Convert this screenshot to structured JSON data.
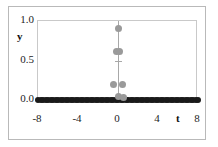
{
  "chart_data": {
    "type": "scatter",
    "title": "",
    "xlabel": "t",
    "ylabel": "y",
    "xlim": [
      -8,
      8
    ],
    "ylim": [
      0.0,
      1.0
    ],
    "xticks": [
      -8,
      -4,
      0,
      4,
      8
    ],
    "xticklabels": [
      "-8",
      "-4",
      "0",
      "4",
      "8"
    ],
    "yticks": [
      0.0,
      0.5,
      1.0
    ],
    "yticklabels": [
      "0.0",
      "0.5",
      "1.0"
    ],
    "grid": false,
    "legend": null,
    "marker_colors": {
      "baseline": "#1a1a1a",
      "impulse": "#9a9a9a",
      "impulse_line": "#a8a8a8"
    },
    "series": [
      {
        "name": "baseline",
        "marker": "filled-circle-black",
        "points": [
          {
            "t": -8.0,
            "y": 0.0
          },
          {
            "t": -7.75,
            "y": 0.0
          },
          {
            "t": -7.5,
            "y": 0.0
          },
          {
            "t": -7.25,
            "y": 0.0
          },
          {
            "t": -7.0,
            "y": 0.0
          },
          {
            "t": -6.75,
            "y": 0.0
          },
          {
            "t": -6.5,
            "y": 0.0
          },
          {
            "t": -6.25,
            "y": 0.0
          },
          {
            "t": -6.0,
            "y": 0.0
          },
          {
            "t": -5.75,
            "y": 0.0
          },
          {
            "t": -5.5,
            "y": 0.0
          },
          {
            "t": -5.25,
            "y": 0.0
          },
          {
            "t": -5.0,
            "y": 0.0
          },
          {
            "t": -4.75,
            "y": 0.0
          },
          {
            "t": -4.5,
            "y": 0.0
          },
          {
            "t": -4.25,
            "y": 0.0
          },
          {
            "t": -4.0,
            "y": 0.0
          },
          {
            "t": -3.75,
            "y": 0.0
          },
          {
            "t": -3.5,
            "y": 0.0
          },
          {
            "t": -3.25,
            "y": 0.0
          },
          {
            "t": -3.0,
            "y": 0.0
          },
          {
            "t": -2.75,
            "y": 0.0
          },
          {
            "t": -2.5,
            "y": 0.0
          },
          {
            "t": -2.25,
            "y": 0.0
          },
          {
            "t": -2.0,
            "y": 0.0
          },
          {
            "t": -1.75,
            "y": 0.0
          },
          {
            "t": -1.5,
            "y": 0.0
          },
          {
            "t": -1.25,
            "y": 0.0
          },
          {
            "t": -1.0,
            "y": 0.0
          },
          {
            "t": -0.75,
            "y": 0.0
          },
          {
            "t": -0.5,
            "y": 0.0
          },
          {
            "t": -0.25,
            "y": 0.0
          },
          {
            "t": 0.0,
            "y": 0.0
          },
          {
            "t": 0.25,
            "y": 0.0
          },
          {
            "t": 0.5,
            "y": 0.0
          },
          {
            "t": 0.75,
            "y": 0.0
          },
          {
            "t": 1.0,
            "y": 0.0
          },
          {
            "t": 1.25,
            "y": 0.0
          },
          {
            "t": 1.5,
            "y": 0.0
          },
          {
            "t": 1.75,
            "y": 0.0
          },
          {
            "t": 2.0,
            "y": 0.0
          },
          {
            "t": 2.25,
            "y": 0.0
          },
          {
            "t": 2.5,
            "y": 0.0
          },
          {
            "t": 2.75,
            "y": 0.0
          },
          {
            "t": 3.0,
            "y": 0.0
          },
          {
            "t": 3.25,
            "y": 0.0
          },
          {
            "t": 3.5,
            "y": 0.0
          },
          {
            "t": 3.75,
            "y": 0.0
          },
          {
            "t": 4.0,
            "y": 0.0
          },
          {
            "t": 4.25,
            "y": 0.0
          },
          {
            "t": 4.5,
            "y": 0.0
          },
          {
            "t": 4.75,
            "y": 0.0
          },
          {
            "t": 5.0,
            "y": 0.0
          },
          {
            "t": 5.25,
            "y": 0.0
          },
          {
            "t": 5.5,
            "y": 0.0
          },
          {
            "t": 5.75,
            "y": 0.0
          },
          {
            "t": 6.0,
            "y": 0.0
          },
          {
            "t": 6.25,
            "y": 0.0
          },
          {
            "t": 6.5,
            "y": 0.0
          },
          {
            "t": 6.75,
            "y": 0.0
          },
          {
            "t": 7.0,
            "y": 0.0
          },
          {
            "t": 7.25,
            "y": 0.0
          },
          {
            "t": 7.5,
            "y": 0.0
          },
          {
            "t": 7.75,
            "y": 0.0
          },
          {
            "t": 8.0,
            "y": 0.0
          }
        ]
      },
      {
        "name": "impulse",
        "marker": "filled-circle-gray",
        "points": [
          {
            "t": 0.0,
            "y": 0.9
          },
          {
            "t": -0.15,
            "y": 0.61
          },
          {
            "t": 0.15,
            "y": 0.61
          },
          {
            "t": -0.45,
            "y": 0.19
          },
          {
            "t": 0.45,
            "y": 0.19
          },
          {
            "t": 0.0,
            "y": 0.04
          },
          {
            "t": 0.55,
            "y": 0.03
          }
        ]
      }
    ],
    "impulse_line": {
      "t": 0.0,
      "y_from": 0.0,
      "y_to": 1.0
    },
    "impulse_tick": {
      "t": 0.0,
      "y": 0.5,
      "half_width_t": 0.35
    }
  }
}
